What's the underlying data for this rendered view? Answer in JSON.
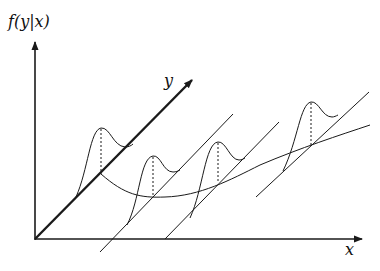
{
  "diagram": {
    "labels": {
      "vertical_axis": "f(y|x)",
      "depth_axis": "y",
      "horizontal_axis": "x"
    },
    "colors": {
      "background": "#ffffff",
      "stroke": "#1a1a1a"
    },
    "elements": {
      "densities_count": 4,
      "density_shape": "skewed unimodal curve drawn above each y-line",
      "mode_markers": "dashed vertical line from each density peak to the regression curve",
      "regression_curve": "curve connecting conditional means, dipping then rising with x"
    }
  }
}
